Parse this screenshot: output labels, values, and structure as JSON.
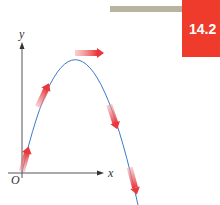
{
  "header": {
    "section_number": "14.2",
    "badge_color": "#ef3b2c",
    "bar_color": "#b8b4a0"
  },
  "diagram": {
    "type": "projectile-trajectory",
    "axes": {
      "x_label": "x",
      "y_label": "y",
      "origin_label": "O"
    },
    "curve_color": "#3a7bc8",
    "arrow_color": "#e8383d",
    "velocity_arrows": [
      {
        "position": "start",
        "direction": "up-steep"
      },
      {
        "position": "rising",
        "direction": "up-right"
      },
      {
        "position": "peak",
        "direction": "horizontal-right"
      },
      {
        "position": "falling",
        "direction": "down-right"
      },
      {
        "position": "end",
        "direction": "down-steep"
      }
    ]
  }
}
